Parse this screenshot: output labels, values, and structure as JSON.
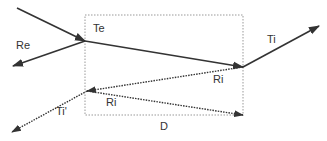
{
  "diagram": {
    "type": "ray-optics-slab",
    "colors": {
      "line": "#333333",
      "box": "#999999",
      "background": "#ffffff"
    },
    "labels": {
      "te": "Te",
      "re": "Re",
      "ti": "Ti",
      "ri_upper": "Ri",
      "ri_lower": "Ri",
      "ti_prime": "Ti'",
      "d": "D"
    },
    "box": {
      "x": 85,
      "y": 15,
      "width": 158,
      "height": 100,
      "style": "dotted"
    },
    "rays": [
      {
        "name": "incident",
        "from": [
          17,
          8
        ],
        "to": [
          85,
          41
        ],
        "style": "solid"
      },
      {
        "name": "Re",
        "from": [
          85,
          41
        ],
        "to": [
          13,
          66
        ],
        "style": "solid"
      },
      {
        "name": "Te",
        "from": [
          85,
          41
        ],
        "to": [
          243,
          67
        ],
        "style": "solid"
      },
      {
        "name": "Ti",
        "from": [
          243,
          67
        ],
        "to": [
          319,
          26
        ],
        "style": "solid"
      },
      {
        "name": "Ri-upper",
        "from": [
          243,
          67
        ],
        "to": [
          87,
          91
        ],
        "style": "dotted"
      },
      {
        "name": "Ri-lower",
        "from": [
          87,
          91
        ],
        "to": [
          243,
          115
        ],
        "style": "dotted"
      },
      {
        "name": "Ti-prime",
        "from": [
          87,
          91
        ],
        "to": [
          12,
          132
        ],
        "style": "dotted"
      }
    ]
  }
}
